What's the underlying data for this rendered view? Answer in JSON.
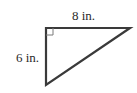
{
  "diagram": {
    "type": "right-triangle",
    "sides": {
      "top": {
        "label": "8 in.",
        "length": 8,
        "unit": "in."
      },
      "left": {
        "label": "6 in.",
        "length": 6,
        "unit": "in."
      }
    },
    "right_angle_marker": true,
    "colors": {
      "stroke": "#3a3a3a",
      "marker": "#7a7a7a",
      "background": "#ffffff",
      "text": "#2a2a2a"
    }
  }
}
